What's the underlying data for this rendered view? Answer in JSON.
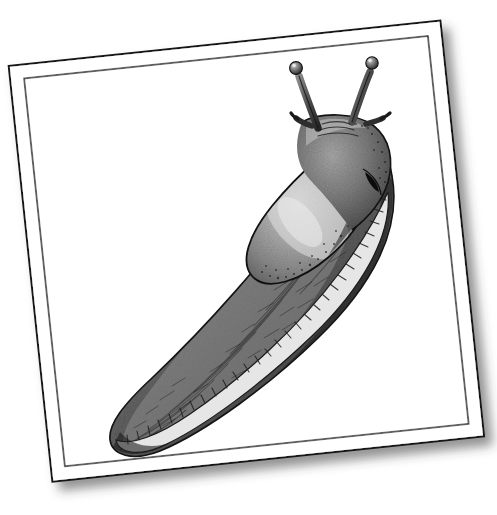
{
  "document": {
    "kind": "scientific-illustration-plate",
    "subject_label": "Slug",
    "medium": "pen-and-ink stipple drawing",
    "background_color": "#ffffff",
    "paper_color": "#ffffff"
  },
  "card": {
    "rotation_degrees": -6,
    "outer_corners": {
      "top_left": [
        26,
        58
      ],
      "top_right": [
        448,
        32
      ],
      "bottom_right": [
        466,
        455
      ],
      "bottom_left": [
        57,
        483
      ]
    },
    "border": {
      "outer_line_color": "#121212",
      "outer_line_width": 2.0,
      "inner_line_color": "#1a1a1a",
      "inner_line_width": 1.4,
      "inner_inset_px": 14
    },
    "shadow": {
      "color": "#3a3a3a",
      "offset_x": 7,
      "offset_y": 9,
      "blur": 11,
      "opacity": 0.55
    }
  },
  "illustration": {
    "name": "slug",
    "orientation": "diagonal, head upper-right, tail lower-left",
    "palette": {
      "body_dark": "#2c2c2c",
      "body_mid": "#6e6e6e",
      "body_light": "#a8a8a8",
      "mantle_highlight": "#d2d2d2",
      "outline": "#151515",
      "sole_band": "#e3e3e3",
      "sole_tick": "#2a2a2a",
      "pneumostome": "#0d0d0d"
    },
    "parts": [
      {
        "id": "eye-tentacle-left",
        "label": "Left optical tentacle",
        "tip": [
          296,
          66
        ]
      },
      {
        "id": "eye-tentacle-right",
        "label": "Right optical tentacle",
        "tip": [
          372,
          62
        ]
      },
      {
        "id": "lower-tentacle-left",
        "label": "Left sensory tentacle",
        "tip": [
          303,
          118
        ]
      },
      {
        "id": "lower-tentacle-right",
        "label": "Right sensory tentacle",
        "tip": [
          366,
          116
        ]
      },
      {
        "id": "head",
        "label": "Head",
        "center": [
          333,
          128
        ]
      },
      {
        "id": "mantle",
        "label": "Mantle shield",
        "center": [
          320,
          205
        ]
      },
      {
        "id": "pneumostome",
        "label": "Pneumostome (breathing pore)",
        "center": [
          373,
          184
        ]
      },
      {
        "id": "body-keel",
        "label": "Dorsal keel",
        "center": [
          258,
          300
        ]
      },
      {
        "id": "tail",
        "label": "Tail tip",
        "center": [
          142,
          437
        ]
      },
      {
        "id": "foot-fringe",
        "label": "Foot sole fringe",
        "center": [
          250,
          380
        ]
      }
    ]
  }
}
